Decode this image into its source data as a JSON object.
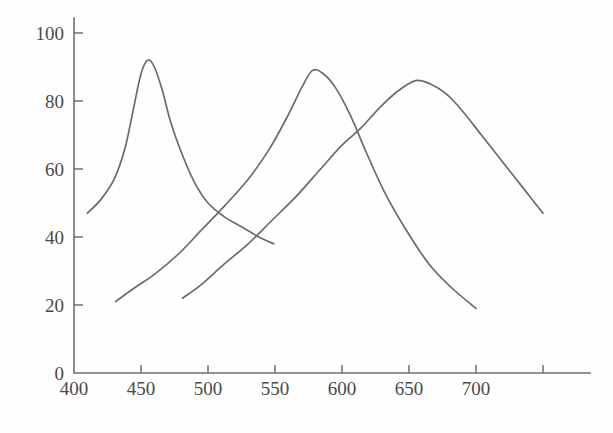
{
  "chart_data": {
    "type": "line",
    "title": "",
    "subtitle": "",
    "xlabel": "",
    "ylabel": "",
    "xlim": [
      400,
      760
    ],
    "ylim": [
      0,
      105
    ],
    "grid": false,
    "legend": "none",
    "background_color": "#fefefe",
    "line_color": "#6b6b6b",
    "axis_color": "#6e6e6e",
    "x_ticks": [
      400,
      450,
      500,
      550,
      600,
      650,
      700,
      750
    ],
    "x_tick_labels": [
      "400",
      "450",
      "500",
      "550",
      "600",
      "650",
      "700",
      ""
    ],
    "y_ticks": [
      0,
      20,
      40,
      60,
      80,
      100
    ],
    "y_tick_labels": [
      "0",
      "20",
      "40",
      "60",
      "80",
      "100"
    ],
    "series": [
      {
        "name": "short-wavelength curve",
        "peak_x": 455,
        "peak_y": 92,
        "x": [
          410,
          420,
          430,
          438,
          444,
          450,
          455,
          460,
          466,
          472,
          480,
          490,
          500,
          512,
          525,
          538,
          549
        ],
        "y": [
          47,
          51,
          57,
          66,
          77,
          88,
          92,
          90,
          83,
          74,
          65,
          56,
          50,
          46,
          43,
          40,
          38
        ]
      },
      {
        "name": "medium-wavelength curve",
        "peak_x": 578,
        "peak_y": 89,
        "x": [
          431,
          445,
          460,
          478,
          495,
          512,
          530,
          546,
          560,
          570,
          578,
          586,
          595,
          606,
          618,
          632,
          648,
          665,
          682,
          700
        ],
        "y": [
          21,
          25,
          29,
          35,
          42,
          49,
          57,
          66,
          76,
          84,
          89,
          88,
          84,
          76,
          65,
          53,
          42,
          32,
          25,
          19
        ]
      },
      {
        "name": "long-wavelength curve",
        "peak_x": 655,
        "peak_y": 86,
        "x": [
          481,
          495,
          512,
          530,
          548,
          566,
          584,
          600,
          614,
          628,
          642,
          655,
          666,
          678,
          690,
          704,
          720,
          736,
          750
        ],
        "y": [
          22,
          26,
          32,
          38,
          45,
          52,
          60,
          67,
          72,
          78,
          83,
          86,
          85,
          82,
          77,
          70,
          62,
          54,
          47
        ]
      }
    ]
  }
}
